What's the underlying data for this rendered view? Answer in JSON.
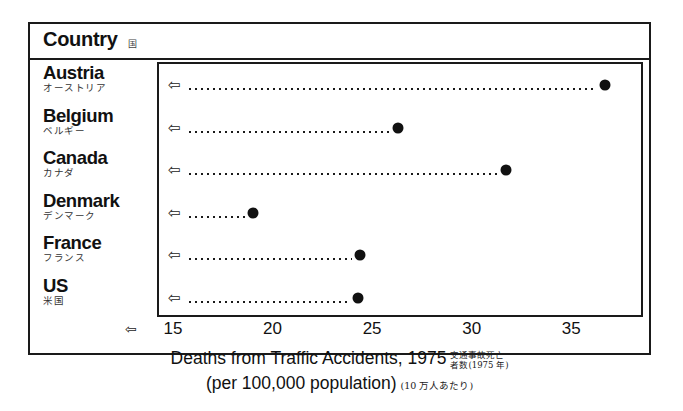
{
  "header": {
    "title": "Country",
    "title_ja": "国"
  },
  "axis": {
    "arrow_icon": "⇦",
    "ticks": [
      "15",
      "20",
      "25",
      "30",
      "35"
    ],
    "tick_values": [
      15,
      20,
      25,
      30,
      35
    ]
  },
  "caption": {
    "line1_en": "Deaths from Traffic Accidents, 1975",
    "line1_ja_a": "交通事故死亡",
    "line1_ja_b": "者数(1975 年)",
    "line2_en": "(per 100,000 population)",
    "line2_ja": "(10 万人あたり)"
  },
  "rows": [
    {
      "en": "Austria",
      "ja": "オーストリア",
      "value": 36.6,
      "arrow_icon": "⇦"
    },
    {
      "en": "Belgium",
      "ja": "ベルギー",
      "value": 26.2,
      "arrow_icon": "⇦"
    },
    {
      "en": "Canada",
      "ja": "カナダ",
      "value": 31.6,
      "arrow_icon": "⇦"
    },
    {
      "en": "Denmark",
      "ja": "デンマーク",
      "value": 18.9,
      "arrow_icon": "⇦"
    },
    {
      "en": "France",
      "ja": "フランス",
      "value": 24.3,
      "arrow_icon": "⇦"
    },
    {
      "en": "US",
      "ja": "米国",
      "value": 24.2,
      "arrow_icon": "⇦"
    }
  ],
  "chart_data": {
    "type": "scatter",
    "xlabel": "Deaths from Traffic Accidents, 1975 (per 100,000 population)",
    "ylabel": "Country",
    "categories": [
      "Austria",
      "Belgium",
      "Canada",
      "Denmark",
      "France",
      "US"
    ],
    "values": [
      36.6,
      26.2,
      31.6,
      18.9,
      24.3,
      24.2
    ],
    "xlim": [
      14.2,
      38.6
    ],
    "xticks": [
      15,
      20,
      25,
      30,
      35
    ],
    "grid": false,
    "legend": "none",
    "orientation": "horizontal",
    "marker": "filled-circle",
    "leader_lines": "dotted"
  },
  "colors": {
    "ink": "#1a1a1a",
    "marker": "#111111",
    "background": "#ffffff"
  }
}
